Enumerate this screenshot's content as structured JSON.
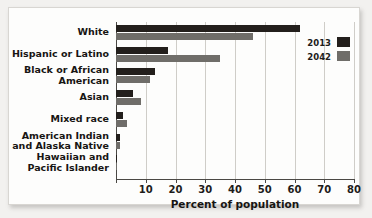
{
  "chart_data": {
    "type": "bar",
    "orientation": "horizontal",
    "title": "",
    "xlabel": "Percent of population",
    "ylabel": "",
    "xlim": [
      0,
      80
    ],
    "xticks": [
      0,
      10,
      20,
      30,
      40,
      50,
      60,
      70,
      80
    ],
    "xtick_labels": [
      "",
      "10",
      "20",
      "30",
      "40",
      "50",
      "60",
      "70",
      "80"
    ],
    "grid": true,
    "grid_axis": "x",
    "legend_position": "top-right",
    "categories": [
      "White",
      "Hispanic or Latino",
      "Black or African American",
      "Asian",
      "Mixed race",
      "American Indian and Alaska Native",
      "Hawaiian and Pacific Islander"
    ],
    "category_lines": [
      [
        "White"
      ],
      [
        "Hispanic or Latino"
      ],
      [
        "Black or African",
        "American"
      ],
      [
        "Asian"
      ],
      [
        "Mixed race"
      ],
      [
        "American Indian",
        "and Alaska Native"
      ],
      [
        "Hawaiian and",
        "Pacific Islander"
      ]
    ],
    "series": [
      {
        "name": "2013",
        "color": "#231f1c",
        "values": [
          62,
          17.4,
          13.1,
          5.7,
          2.4,
          1.2,
          0.2
        ]
      },
      {
        "name": "2042",
        "color": "#6f6d69",
        "values": [
          46,
          34.9,
          11.4,
          8.4,
          3.7,
          1.4,
          0.3
        ]
      }
    ]
  },
  "legend": {
    "items": [
      {
        "label": "2013",
        "color": "#231f1c"
      },
      {
        "label": "2042",
        "color": "#6f6d69"
      }
    ]
  },
  "axis": {
    "x_title": "Percent of population"
  },
  "watermark": {
    "line_a": "",
    "line_b": ""
  },
  "colors": {
    "series_2013": "#231f1c",
    "series_2042": "#6f6d69",
    "axis": "#4a4844",
    "gridline": "#cfcdc8",
    "plate_background": "#fdfdfc",
    "page_background": "#f2f1ef",
    "text": "#17151a"
  }
}
